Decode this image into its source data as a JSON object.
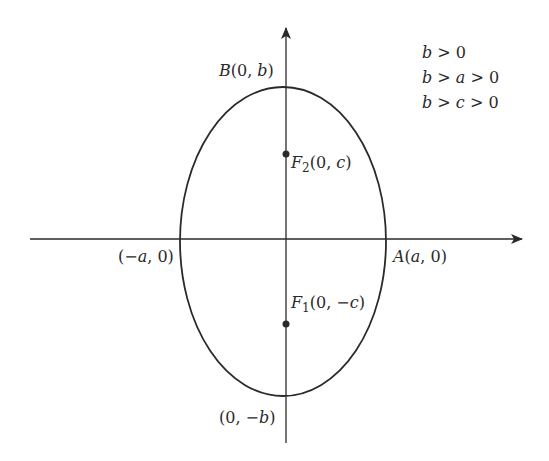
{
  "diagram": {
    "conditions": [
      "b > 0",
      "b > a > 0",
      "b > c > 0"
    ],
    "labels": {
      "top_vertex": "B(0, b)",
      "bottom_vertex": "(0, −b)",
      "left_vertex": "(−a, 0)",
      "right_vertex": "A(a, 0)",
      "focus_upper": "F2(0, c)",
      "focus_lower": "F1(0, −c)"
    },
    "colors": {
      "stroke": "#2a2a2a",
      "background": "#ffffff"
    }
  }
}
